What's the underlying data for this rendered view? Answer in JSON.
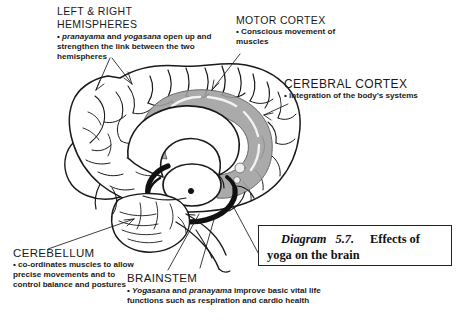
{
  "figure": {
    "ink_color": "#1a1a1a",
    "shade_color": "#9a9a9a",
    "background": "#ffffff"
  },
  "annotations": [
    {
      "id": "hemispheres",
      "heading_line1": "LEFT & RIGHT",
      "heading_line2": "HEMISPHERES",
      "bullet": "•",
      "body_pre": " ",
      "body_italic1": "pranayama",
      "body_mid1": " and ",
      "body_italic2": "yogasana",
      "body_post": " open up and strengthen the link between the two hemispheres",
      "body_full": "• pranayama and yogasana open up and strengthen the link between the two hemispheres"
    },
    {
      "id": "motor-cortex",
      "heading": "MOTOR CORTEX",
      "bullet": "•",
      "body": " Conscious movement of muscles"
    },
    {
      "id": "cerebral-cortex",
      "heading": "CEREBRAL CORTEX",
      "bullet": "•",
      "body": "  integration of the body’s systems"
    },
    {
      "id": "cerebellum",
      "heading": "CEREBELLUM",
      "bullet": "•",
      "body": " co-ordinates muscles to allow precise movements and to control balance and postures"
    },
    {
      "id": "brainstem",
      "heading": "BRAINSTEM",
      "bullet": "•",
      "body_italic1": "Yogasana",
      "body_mid1": " and ",
      "body_italic2": "pranayama",
      "body_post": " improve basic vital life functions such as respiration and cardio health",
      "body_full": "• Yogasana and pranayama improve basic vital life functions such as respiration and cardio health"
    }
  ],
  "caption": {
    "label": "Diagram",
    "number": "5.7.",
    "text_line1": "Effects of",
    "text_line2": "yoga on the brain",
    "full": "Diagram 5.7. Effects of yoga on the brain"
  }
}
